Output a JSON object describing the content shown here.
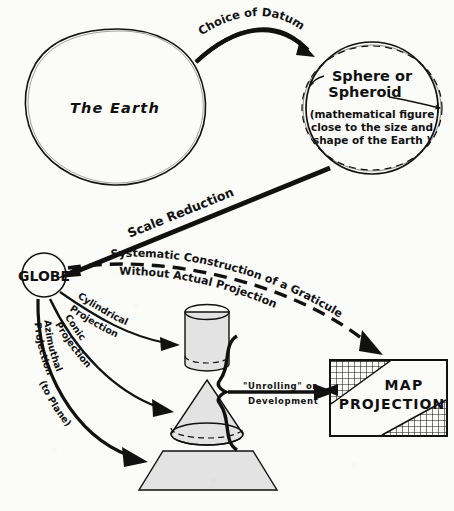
{
  "diagram": {
    "background_color": "#fbfbf9",
    "ink_color": "#111111",
    "shape_fill_color": "#e3e3e3"
  },
  "nodes": {
    "earth": {
      "label": "The  Earth",
      "shape": "hand-drawn circle"
    },
    "spheroid": {
      "title_line1": "Sphere or",
      "title_line2": "Spheroid",
      "note_line1": "(mathematical figure",
      "note_line2": "close to the size and",
      "note_line3": "shape of the Earth )",
      "shape": "circle with dashed ellipse overlay"
    },
    "globe": {
      "label": "GLOBE",
      "shape": "circle"
    },
    "map_projection": {
      "line1": "MAP",
      "line2": "PROJECTION",
      "shape": "rectangle with graticule corners"
    },
    "cylinder": {
      "label": "",
      "shape": "cylinder"
    },
    "cone": {
      "label": "",
      "shape": "cone"
    },
    "plane": {
      "label": "",
      "shape": "trapezoid plane"
    }
  },
  "edges": {
    "choice_of_datum": "Choice  of  Datum",
    "scale_reduction": "Scale Reduction",
    "systematic_line1": "Systematic  Construction  of a Graticule",
    "systematic_line2": "Without   Actual   Projection",
    "cylindrical_line1": "Cylindrical",
    "cylindrical_line2": "Projection",
    "conic_line1": "Conic",
    "conic_line2": "Projection",
    "azimuthal_line1": "Azimuthal",
    "azimuthal_line2": "Projection",
    "azimuthal_line3": "(to Plane)",
    "unrolling_line1": "\"Unrolling\"  or",
    "unrolling_line2": "Development"
  }
}
